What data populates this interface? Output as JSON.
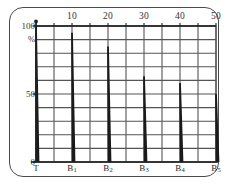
{
  "chart_data": {
    "type": "bar",
    "title": "",
    "subtitle": "",
    "xlabel": "",
    "ylabel": "%",
    "categories": [
      "T",
      "B1",
      "B2",
      "B3",
      "B4",
      "B5"
    ],
    "category_labels": [
      "T",
      "B",
      "B",
      "B",
      "B",
      "B"
    ],
    "category_subscripts": [
      "",
      "1",
      "2",
      "3",
      "4",
      "5"
    ],
    "x_positions": [
      0,
      10,
      20,
      30,
      40,
      50
    ],
    "values": [
      100,
      95,
      85,
      63,
      58,
      50
    ],
    "xlim": [
      0,
      50
    ],
    "ylim": [
      0,
      100
    ],
    "x_ticks": [
      0,
      5,
      10,
      15,
      20,
      25,
      30,
      35,
      40,
      45,
      50
    ],
    "x_tick_labels": [
      "10",
      "20",
      "30",
      "40",
      "50"
    ],
    "x_tick_label_positions": [
      10,
      20,
      30,
      40,
      50
    ],
    "y_ticks": [
      0,
      10,
      20,
      30,
      40,
      50,
      60,
      70,
      80,
      90,
      100
    ],
    "y_tick_labels": [
      "0",
      "50",
      "100"
    ],
    "y_tick_label_values": [
      0,
      50,
      100
    ],
    "y_unit_label": "%",
    "grid": true,
    "x_axis_position": "top",
    "legend": null,
    "series": [
      {
        "name": "spike",
        "values": [
          100,
          95,
          85,
          63,
          58,
          50
        ]
      }
    ],
    "colors": {
      "grid": "#555555",
      "axis": "#222222",
      "bar": "#1a1a1a",
      "frame": "#4a4a4a",
      "background": "#ffffff"
    }
  }
}
